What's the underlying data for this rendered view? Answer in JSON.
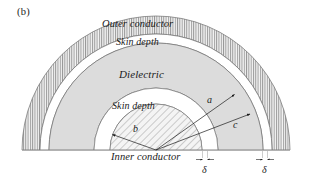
{
  "figure": {
    "panel_tag": "(b)",
    "type": "cross-section-diagram",
    "background_color": "#ffffff",
    "ink_color": "#1b1b1b"
  },
  "geometry": {
    "center_x": 156,
    "center_y": 150,
    "radii": {
      "outer_conductor_outer": 134,
      "outer_conductor_inner": 116,
      "outer_skin_gap_inner": 107,
      "dielectric_inner": 62,
      "inner_skin_gap_inner": 46
    },
    "angle_span_deg": 180
  },
  "regions": [
    {
      "name": "outer-conductor",
      "label": "Outer conductor",
      "hatch": "vertical",
      "fill_color": "#e2e2e2"
    },
    {
      "name": "outer-skin-depth",
      "label": "Skin depth",
      "hatch": "none",
      "fill_color": "#ffffff"
    },
    {
      "name": "dielectric",
      "label": "Dielectric",
      "hatch": "none",
      "fill_color": "#dcdcdc"
    },
    {
      "name": "inner-skin-depth",
      "label": "Skin depth",
      "hatch": "none",
      "fill_color": "#ffffff"
    },
    {
      "name": "inner-conductor",
      "label": "Inner conductor",
      "hatch": "diagonal",
      "fill_color": "#e6e6e6"
    }
  ],
  "labels": {
    "outer_conductor": "Outer conductor",
    "skin_depth_outer": "Skin depth",
    "dielectric": "Dielectric",
    "skin_depth_inner": "Skin depth",
    "inner_conductor": "Inner conductor",
    "radius_a": "a",
    "radius_b": "b",
    "radius_c": "c",
    "delta_left": "δ",
    "delta_right": "δ"
  },
  "dimensions": {
    "radius_a_description": "inner radius of outer conductor",
    "radius_b_description": "radius of inner conductor",
    "radius_c_description": "outer radius of outer conductor",
    "delta_description": "skin depth"
  }
}
